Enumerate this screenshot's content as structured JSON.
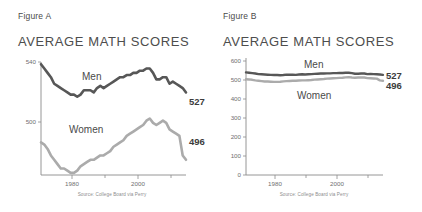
{
  "panels": [
    {
      "caption": "Figure A",
      "title": "AVERAGE MATH SCORES",
      "source": "Source: College Board via Perry"
    },
    {
      "caption": "Figure B",
      "title": "AVERAGE MATH SCORES",
      "source": "Source: College Board via Perry"
    }
  ],
  "labels": {
    "men": "Men",
    "women": "Women",
    "men_end_value": "527",
    "women_end_value": "496",
    "x_tick_1980": "1980",
    "x_tick_2000": "2000",
    "a_y_top": "540",
    "a_y_bottom": "500",
    "b_y_0": "0",
    "b_y_100": "100",
    "b_y_200": "200",
    "b_y_300": "300",
    "b_y_400": "400",
    "b_y_500": "500",
    "b_y_600": "600"
  },
  "colors": {
    "men_line": "#575757",
    "women_line": "#ababab",
    "axis": "#8a8a8a",
    "text": "#4a4a4a",
    "muted_text": "#8d8d8d",
    "background": "#ffffff"
  },
  "chart_data": [
    {
      "type": "line",
      "title": "AVERAGE MATH SCORES",
      "subtitle": "Figure A",
      "xlabel": "",
      "ylabel": "",
      "xlim": [
        1972,
        2016
      ],
      "ylim": [
        489,
        541
      ],
      "y_ticks": [
        500,
        540
      ],
      "x_ticks": [
        1980,
        2000
      ],
      "x_minor_ticks": [
        1990,
        2010
      ],
      "grid": false,
      "legend": "inline-labels",
      "axis_truncated": true,
      "note": "Y axis truncated to 500-540 range, exaggerating variation",
      "x": [
        1972,
        1973,
        1974,
        1975,
        1976,
        1977,
        1978,
        1979,
        1980,
        1981,
        1982,
        1983,
        1984,
        1985,
        1986,
        1987,
        1988,
        1989,
        1990,
        1991,
        1992,
        1993,
        1994,
        1995,
        1996,
        1997,
        1998,
        1999,
        2000,
        2001,
        2002,
        2003,
        2004,
        2005,
        2006,
        2007,
        2008,
        2009,
        2010,
        2011,
        2012,
        2013,
        2014,
        2015,
        2016
      ],
      "series": [
        {
          "name": "Men",
          "color": "#575757",
          "end_value": 527,
          "values": [
            540,
            538,
            536,
            534,
            531,
            530,
            529,
            528,
            527,
            526,
            526,
            525,
            526,
            528,
            528,
            528,
            527,
            529,
            530,
            529,
            530,
            531,
            532,
            533,
            534,
            534,
            535,
            535,
            536,
            536,
            537,
            537,
            538,
            538,
            536,
            533,
            533,
            534,
            534,
            531,
            532,
            531,
            530,
            529,
            527
          ]
        },
        {
          "name": "Women",
          "color": "#ababab",
          "end_value": 496,
          "values": [
            504,
            503,
            501,
            498,
            496,
            494,
            492,
            492,
            491,
            490,
            490,
            491,
            493,
            494,
            495,
            496,
            496,
            497,
            498,
            498,
            499,
            500,
            502,
            503,
            504,
            505,
            507,
            508,
            509,
            510,
            511,
            512,
            514,
            515,
            513,
            512,
            513,
            514,
            513,
            510,
            509,
            508,
            507,
            498,
            496
          ]
        }
      ]
    },
    {
      "type": "line",
      "title": "AVERAGE MATH SCORES",
      "subtitle": "Figure B",
      "xlabel": "",
      "ylabel": "",
      "xlim": [
        1972,
        2016
      ],
      "ylim": [
        0,
        600
      ],
      "y_ticks": [
        0,
        100,
        200,
        300,
        400,
        500,
        600
      ],
      "x_ticks": [
        1980,
        2000
      ],
      "x_minor_ticks": [
        1990,
        2010
      ],
      "grid": false,
      "legend": "inline-labels",
      "axis_truncated": false,
      "note": "Full zero-based Y axis, same data appears nearly flat",
      "x": [
        1972,
        1973,
        1974,
        1975,
        1976,
        1977,
        1978,
        1979,
        1980,
        1981,
        1982,
        1983,
        1984,
        1985,
        1986,
        1987,
        1988,
        1989,
        1990,
        1991,
        1992,
        1993,
        1994,
        1995,
        1996,
        1997,
        1998,
        1999,
        2000,
        2001,
        2002,
        2003,
        2004,
        2005,
        2006,
        2007,
        2008,
        2009,
        2010,
        2011,
        2012,
        2013,
        2014,
        2015,
        2016
      ],
      "series": [
        {
          "name": "Men",
          "color": "#575757",
          "end_value": 527,
          "values": [
            540,
            538,
            536,
            534,
            531,
            530,
            529,
            528,
            527,
            526,
            526,
            525,
            526,
            528,
            528,
            528,
            527,
            529,
            530,
            529,
            530,
            531,
            532,
            533,
            534,
            534,
            535,
            535,
            536,
            536,
            537,
            537,
            538,
            538,
            536,
            533,
            533,
            534,
            534,
            531,
            532,
            531,
            530,
            529,
            527
          ]
        },
        {
          "name": "Women",
          "color": "#ababab",
          "end_value": 496,
          "values": [
            504,
            503,
            501,
            498,
            496,
            494,
            492,
            492,
            491,
            490,
            490,
            491,
            493,
            494,
            495,
            496,
            496,
            497,
            498,
            498,
            499,
            500,
            502,
            503,
            504,
            505,
            507,
            508,
            509,
            510,
            511,
            512,
            514,
            515,
            513,
            512,
            513,
            514,
            513,
            510,
            509,
            508,
            507,
            498,
            496
          ]
        }
      ]
    }
  ]
}
